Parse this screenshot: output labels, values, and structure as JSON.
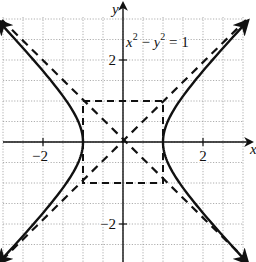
{
  "figure": {
    "equation_label": {
      "base_x": "x",
      "exp_x": "2",
      "minus": " − ",
      "base_y": "y",
      "exp_y": "2",
      "rhs": " = 1"
    },
    "axes": {
      "x_label": "x",
      "y_label": "y",
      "x_ticks": [
        {
          "value": -2,
          "label": "−2"
        },
        {
          "value": 2,
          "label": "2"
        }
      ],
      "y_ticks": [
        {
          "value": 2,
          "label": "2"
        },
        {
          "value": -2,
          "label": "−2"
        }
      ]
    },
    "grid": {
      "step": 0.5,
      "xmin": -3,
      "xmax": 3,
      "ymin": -3.1,
      "ymax": 3
    },
    "curves": [
      {
        "name": "hyperbola-right-branch",
        "equation": "x^2 - y^2 = 1",
        "style": "solid"
      },
      {
        "name": "hyperbola-left-branch",
        "equation": "x^2 - y^2 = 1",
        "style": "solid"
      },
      {
        "name": "asymptote-positive",
        "equation": "y = x",
        "style": "dashed"
      },
      {
        "name": "asymptote-negative",
        "equation": "y = -x",
        "style": "dashed"
      },
      {
        "name": "central-box",
        "corners": [
          [
            -1,
            -1
          ],
          [
            1,
            1
          ]
        ],
        "style": "dashed"
      }
    ],
    "colors": {
      "ink": "#111111",
      "grid": "#9a9a9a",
      "background": "#ffffff"
    }
  }
}
